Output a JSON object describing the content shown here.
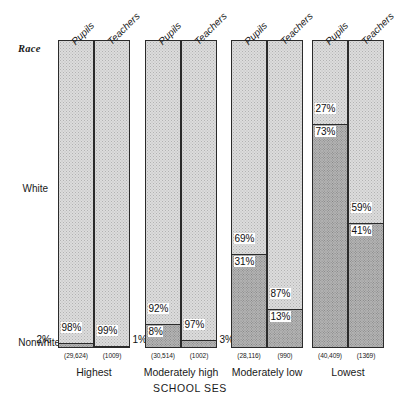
{
  "chart_data": {
    "type": "bar",
    "subtype": "100% stacked bar, grouped",
    "title": "",
    "xlabel": "SCHOOL SES",
    "ylabel": "",
    "legend_title": "Race",
    "ylim": [
      0,
      100
    ],
    "grid": false,
    "legend_position": "y-axis categories (White top, Nonwhite bottom)",
    "stack_categories": [
      "White",
      "Nonwhite"
    ],
    "categories": [
      "Highest",
      "Moderately high",
      "Moderately low",
      "Lowest"
    ],
    "subgroups": [
      "Pupils",
      "Teachers"
    ],
    "groups": [
      {
        "category": "Highest",
        "bars": [
          {
            "subgroup": "Pupils",
            "n": "(29,624)",
            "white": 98,
            "nonwhite": 2,
            "white_label": "98%",
            "nonwhite_label": "2%",
            "nonwhite_label_outside": "left"
          },
          {
            "subgroup": "Teachers",
            "n": "(1009)",
            "white": 99,
            "nonwhite": 1,
            "white_label": "99%",
            "nonwhite_label": "1%",
            "nonwhite_label_outside": "right"
          }
        ]
      },
      {
        "category": "Moderately high",
        "bars": [
          {
            "subgroup": "Pupils",
            "n": "(30,514)",
            "white": 92,
            "nonwhite": 8,
            "white_label": "92%",
            "nonwhite_label": "8%",
            "nonwhite_label_outside": "none"
          },
          {
            "subgroup": "Teachers",
            "n": "(1002)",
            "white": 97,
            "nonwhite": 3,
            "white_label": "97%",
            "nonwhite_label": "3%",
            "nonwhite_label_outside": "right"
          }
        ]
      },
      {
        "category": "Moderately low",
        "bars": [
          {
            "subgroup": "Pupils",
            "n": "(28,116)",
            "white": 69,
            "nonwhite": 31,
            "white_label": "69%",
            "nonwhite_label": "31%",
            "nonwhite_label_outside": "none"
          },
          {
            "subgroup": "Teachers",
            "n": "(990)",
            "white": 87,
            "nonwhite": 13,
            "white_label": "87%",
            "nonwhite_label": "13%",
            "nonwhite_label_outside": "none"
          }
        ]
      },
      {
        "category": "Lowest",
        "bars": [
          {
            "subgroup": "Pupils",
            "n": "(40,409)",
            "white": 27,
            "nonwhite": 73,
            "white_label": "27%",
            "nonwhite_label": "73%",
            "nonwhite_label_outside": "none"
          },
          {
            "subgroup": "Teachers",
            "n": "(1369)",
            "white": 59,
            "nonwhite": 41,
            "white_label": "59%",
            "nonwhite_label": "41%",
            "nonwhite_label_outside": "none"
          }
        ]
      }
    ],
    "colors": {
      "white_fill": "#dcdcdc",
      "nonwhite_fill": "#b4b4b4",
      "outline": "#2b2b2b",
      "text": "#1a1a1a",
      "background": "#ffffff"
    }
  },
  "axis": {
    "race_label": "Race",
    "white_label": "White",
    "nonwhite_label": "Nonwhite",
    "x_title": "SCHOOL SES"
  }
}
